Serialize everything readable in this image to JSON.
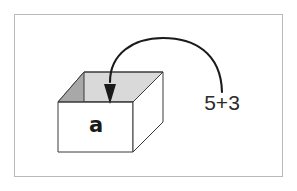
{
  "figure": {
    "background_color": "#ffffff",
    "frame_border_color": "#b9b9bb",
    "box": {
      "label": "a",
      "label_color": "#1a1a1a",
      "outline_color": "#3a3a3a",
      "front_face_color": "#ffffff",
      "right_face_color": "#ffffff",
      "inner_back_color": "#d9d9d9",
      "inner_left_color": "#a8a8a8",
      "rim_top_color": "#cfcfcf"
    },
    "arrow": {
      "label": "curved-arrow-into-box",
      "color": "#1a1a1a",
      "direction": "right-to-left-into-box"
    },
    "expression": {
      "text": "5+3",
      "color": "#2b2b2b"
    }
  }
}
